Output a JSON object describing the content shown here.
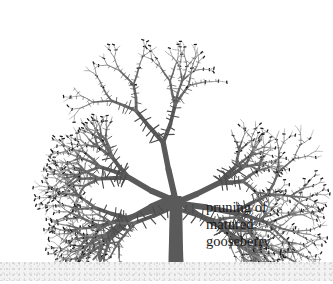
{
  "figure": {
    "title": "pruning of matured gooseberry",
    "style": "black-and-white botanical line illustration",
    "background_color": "#ffffff"
  },
  "caption": {
    "lines": [
      "pruning of",
      "matured",
      "gooseberry"
    ],
    "line1": "pruning of",
    "line2": "matured",
    "line3": "gooseberry",
    "color": "#1a1a1a",
    "x": 206,
    "y": 199
  },
  "ground": {
    "label": "soil-line",
    "color": "#f2f2f2",
    "stipple_color": "#c9c9c9",
    "top": 262,
    "height": 19
  },
  "plant": {
    "trunk": {
      "label": "main-trunk",
      "color": "#5a5a5a",
      "base_x": 176,
      "base_y": 262,
      "fork_y": 196,
      "base_width": 15,
      "top_width": 11
    },
    "branch_color": "#6a6a6a",
    "twig_color": "#8a8a8a",
    "thorn_color": "#4d4d4d",
    "cut_mark_color": "#1c1c1c",
    "canopy": {
      "top": 16,
      "left": 8,
      "right": 328,
      "bottom": 258
    },
    "primary_branches": [
      {
        "name": "left-lower-limb",
        "angle_deg": 206,
        "length": 150
      },
      {
        "name": "left-mid-limb",
        "angle_deg": 193,
        "length": 160
      },
      {
        "name": "left-upper-limb",
        "angle_deg": 160,
        "length": 150
      },
      {
        "name": "center-limb",
        "angle_deg": 95,
        "length": 160
      },
      {
        "name": "right-upper-limb",
        "angle_deg": 30,
        "length": 150
      },
      {
        "name": "right-mid-limb",
        "angle_deg": 352,
        "length": 165
      },
      {
        "name": "right-lower-limb",
        "angle_deg": 330,
        "length": 150
      }
    ],
    "features": {
      "thorns": "short spines along every branch",
      "pruning_cuts": "short dark tick marks across branch tips"
    }
  }
}
